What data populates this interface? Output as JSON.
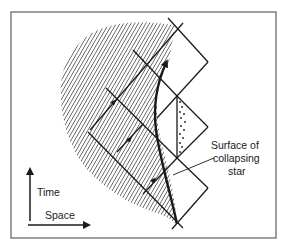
{
  "diagram": {
    "labels": {
      "surface_line1": "Surface of",
      "surface_line2": "collapsing",
      "surface_line3": "star",
      "time_axis": "Time",
      "space_axis": "Space"
    },
    "elements": [
      "hatched-region-star-interior",
      "star-surface-worldline",
      "light-cone-lines",
      "dotted-triangle-region",
      "time-axis-arrow",
      "space-axis-arrow",
      "frame-border"
    ],
    "colors": {
      "ink": "#1a1a1a",
      "hatch": "#4a4a4a",
      "frame": "#6a6a6a",
      "background": "#ffffff"
    }
  }
}
